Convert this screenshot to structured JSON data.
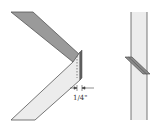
{
  "diagram": {
    "dimension_label": "1/4\"",
    "colors": {
      "dark_board": "#9a9a9a",
      "light_board": "#ececec",
      "outline": "#555555",
      "spline": "#8a8a8a"
    }
  }
}
